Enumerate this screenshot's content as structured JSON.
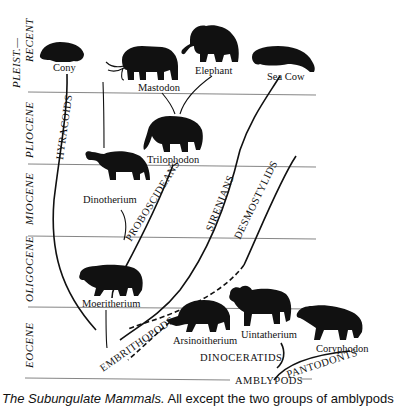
{
  "epochs": [
    {
      "label": "PLEIST.—",
      "label2": "RECENT"
    },
    {
      "label": "PLIOCENE"
    },
    {
      "label": "MIOCENE"
    },
    {
      "label": "OLIGOCENE"
    },
    {
      "label": "EOCENE"
    }
  ],
  "animals": {
    "cony": "Cony",
    "mastodon": "Mastodon",
    "elephant": "Elephant",
    "sea_cow": "Sea Cow",
    "trilophodon": "Trilophodon",
    "dinotherium": "Dinotherium",
    "moeritherium": "Moeritherium",
    "arsinoitherium": "Arsinoitherium",
    "uintatherium": "Uintatherium",
    "coryphodon": "Coryphodon"
  },
  "groups": {
    "hyracoids": "HYRACOIDS",
    "proboscideans": "PROBOSCIDEANS",
    "sirenians": "SIRENIANS",
    "desmostylids": "DESMOSTYLIDS",
    "embrithopods": "EMBRITHOPODS",
    "dinoceratids": "DINOCERATIDS",
    "pantodonts": "PANTODONTS",
    "amblypods": "AMBLYPODS"
  },
  "caption": {
    "title": "The Subungulate Mammals.",
    "text": " All except the two groups of amblypods"
  },
  "colors": {
    "ink": "#111111",
    "rule": "#777777",
    "background": "#ffffff"
  }
}
